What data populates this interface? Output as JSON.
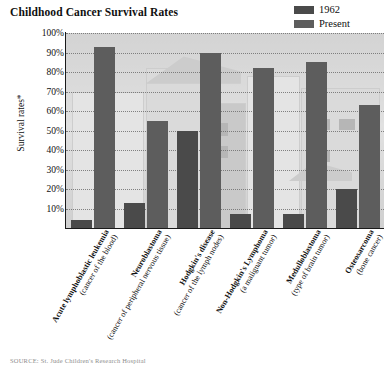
{
  "title": "Childhood Cancer Survival Rates",
  "legend": {
    "position": "top-right",
    "entries": [
      {
        "label": "1962",
        "color": "#4a4a4a"
      },
      {
        "label": "Present",
        "color": "#5d5d5d"
      }
    ]
  },
  "axis": {
    "ylabel": "Survival rates*",
    "yticks": [
      "100%",
      "90%",
      "80%",
      "70%",
      "60%",
      "50%",
      "40%",
      "30%",
      "20%",
      "10%"
    ]
  },
  "source": {
    "text": "SOURCE: St. Jude Children's Research Hospital"
  },
  "colors": {
    "bar_1962": "#4a4a4a",
    "bar_present": "#5d5d5d",
    "axis": "#1a1a1a",
    "gridline": "#6f6f6f",
    "text": "#101010",
    "plot_background": "#d9d9d9"
  },
  "chart_data": {
    "type": "bar",
    "title": "Childhood Cancer Survival Rates",
    "xlabel": "",
    "ylabel": "Survival rates*",
    "ylim": [
      0,
      100
    ],
    "grid": true,
    "legend_position": "top-right",
    "categories": [
      "Acute lymphoblastic leukemia (cancer of the blood)",
      "Neuroblastoma (cancer of peripheral nervous tissue)",
      "Hodgkin's disease (cancer of the lymph nodes)",
      "Non-Hodgkin's Lymphoma (a malignant tumor)",
      "Medulloblastoma (type of brain tumor)",
      "Osteosarcoma (bone cancer)"
    ],
    "category_lines": [
      {
        "line1": "Acute lymphoblastic leukemia",
        "line2": "(cancer of the blood)"
      },
      {
        "line1": "Neuroblastoma",
        "line2": "(cancer of peripheral nervous tissue)"
      },
      {
        "line1": "Hodgkin's disease",
        "line2": "(cancer of the lymph nodes)"
      },
      {
        "line1": "Non-Hodgkin's Lymphoma",
        "line2": "(a malignant tumor)"
      },
      {
        "line1": "Medulloblastoma",
        "line2": "(type of brain tumor)"
      },
      {
        "line1": "Osteosarcoma",
        "line2": "(bone cancer)"
      }
    ],
    "series": [
      {
        "name": "1962",
        "values": [
          4,
          13,
          50,
          7,
          7,
          20
        ]
      },
      {
        "name": "Present",
        "values": [
          93,
          55,
          90,
          82,
          85,
          63
        ]
      }
    ]
  }
}
